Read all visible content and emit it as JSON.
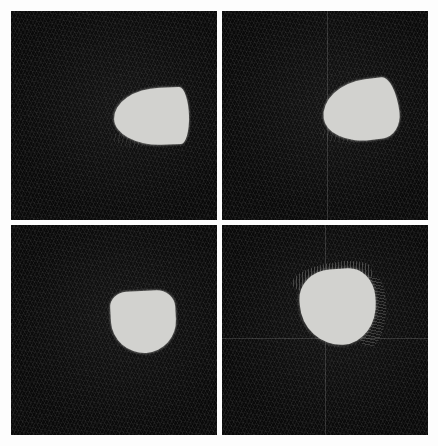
{
  "view": {
    "title": "Segmentation Panel Grid",
    "background_color": "#fdfdfd",
    "layout": "2x2",
    "panel_count": 4,
    "outer_margin_px": 11,
    "panel_gap_px": 5
  },
  "appearance": {
    "panel_background_color": "#0a0a0a",
    "region_fill_color": "#d2d2cf",
    "crosshair_color": "#e1e1e1",
    "halo_color": "#8c8c8a"
  },
  "panels": [
    {
      "id": "panel-top-left",
      "index": "1",
      "label": "",
      "width_px": 206,
      "height_px": 209,
      "crosshair": {
        "visible": false,
        "x_px": null,
        "y_px": null
      },
      "region": {
        "name": "bright-region",
        "shape": "teardrop-pointing-right",
        "left_px": 103,
        "top_px": 77,
        "width_px": 75,
        "height_px": 57,
        "rotation_deg": -2,
        "fill": "#d2d2cf"
      }
    },
    {
      "id": "panel-top-right",
      "index": "2",
      "label": "",
      "width_px": 206,
      "height_px": 209,
      "crosshair": {
        "visible": true,
        "x_px": 105,
        "y_px": null
      },
      "region": {
        "name": "bright-region",
        "shape": "teardrop-tilted-up-right",
        "left_px": 101,
        "top_px": 69,
        "width_px": 76,
        "height_px": 61,
        "rotation_deg": -7,
        "fill": "#d2d2cf"
      }
    },
    {
      "id": "panel-bottom-left",
      "index": "3",
      "label": "",
      "width_px": 206,
      "height_px": 210,
      "crosshair": {
        "visible": false,
        "x_px": null,
        "y_px": null
      },
      "region": {
        "name": "bright-region",
        "shape": "rounded-dome-flat-top",
        "left_px": 100,
        "top_px": 66,
        "width_px": 65,
        "height_px": 62,
        "rotation_deg": -3,
        "fill": "#d2d2cf"
      }
    },
    {
      "id": "panel-bottom-right",
      "index": "4",
      "label": "",
      "width_px": 206,
      "height_px": 210,
      "crosshair": {
        "visible": true,
        "x_px": 103,
        "y_px": 113
      },
      "region": {
        "name": "bright-region",
        "shape": "rounded-blob-with-streak-halo",
        "left_px": 78,
        "top_px": 44,
        "width_px": 76,
        "height_px": 76,
        "rotation_deg": -4,
        "fill": "#d2d2cf"
      }
    }
  ]
}
